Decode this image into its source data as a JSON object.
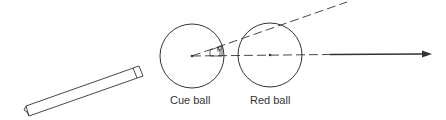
{
  "diagram": {
    "type": "billiards-collision",
    "labels": {
      "cue_ball": "Cue ball",
      "red_ball": "Red ball",
      "angle": "θ"
    },
    "colors": {
      "stroke": "#333333",
      "background": "#ffffff"
    },
    "elements": {
      "cue_stick": "cue-stick",
      "cue_ball": "circle",
      "red_ball": "circle",
      "line_of_centers": "dashed-line-with-arrow",
      "aim_line": "dashed-line",
      "angle_marker": "theta-angle"
    }
  }
}
